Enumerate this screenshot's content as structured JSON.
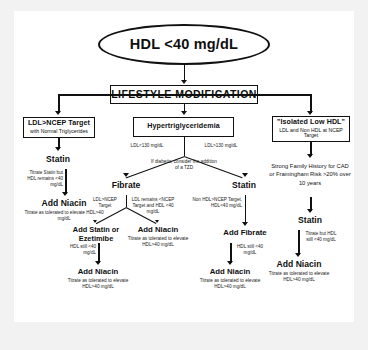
{
  "diagram": {
    "root": "HDL <40 mg/dL",
    "lifestyle": "LIFESTYLE MODIFICATION",
    "branch_left": {
      "box_title": "LDL>NCEP Target",
      "box_sub": "with Normal Triglycerides",
      "step1": "Statin",
      "edge1": "Titrate Statin but HDL remains <40 mg/dL",
      "step2": "Add Niacin",
      "note2": "Titrate as tolerated to elevate HDL>40 mg/dL"
    },
    "branch_mid": {
      "box_title": "Hypertriglyceridemia",
      "edge_left": "LDL<130 mg/dL",
      "edge_right": "LDL>130 mg/dL",
      "tzd_note": "If diabetic, consider the addition of a TZD",
      "fibrate": "Fibrate",
      "statin": "Statin",
      "fib_edge_left": "LDL>NCEP Target",
      "fib_edge_right": "LDL remains <NCEP Target and HDL <40 mg/dL",
      "statin_edge": "Non HDL>NCEP Target, HDL<40 mg/dL",
      "add_statin_ezetimibe": "Add Statin or Ezetimibe",
      "add_niacin_mid": "Add Niacin",
      "add_niacin_mid_note": "Titrate as tolerated to elevate HDL>40 mg/dL",
      "add_fibrate": "Add Fibrate",
      "hdl_still_left": "HDL still <40 mg/dL",
      "hdl_still_right": "HDL still <40 mg/dL",
      "final_left": "Add Niacin",
      "final_left_note": "Titrate as tolerated to elevate HDL>40 mg/dL",
      "final_right": "Add Niacin",
      "final_right_note": "Titrate as tolerated to elevate HDL>40 mg/dL"
    },
    "branch_right": {
      "box_title": "\"Isolated Low HDL\"",
      "box_sub": "LDL and Non HDL at NCEP Target",
      "risk": "Strong Family History for CAD or Framingham Risk >20% over 10 years",
      "step1": "Statin",
      "edge1": "Titrate but HDL still <40 mg/dL",
      "step2": "Add Niacin",
      "note2": "Titrate as tolerated to elevate HDL>40 mg/dL"
    }
  }
}
